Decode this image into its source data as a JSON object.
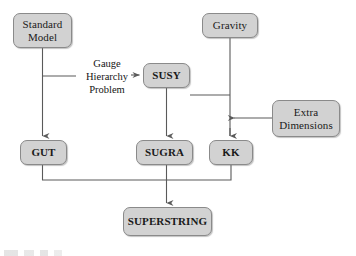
{
  "diagram": {
    "background_color": "#ffffff",
    "node_fill": "#d2d2d2",
    "node_border": "#8a8a8a",
    "line_color": "#5a5a5a",
    "nodes": [
      {
        "id": "standard-model",
        "label": "Standard\nModel",
        "x": 13,
        "y": 13,
        "w": 59,
        "h": 35,
        "font_size": 11
      },
      {
        "id": "gravity",
        "label": "Gravity",
        "x": 202,
        "y": 13,
        "w": 56,
        "h": 25,
        "font_size": 11
      },
      {
        "id": "susy",
        "label": "SUSY",
        "x": 143,
        "y": 63,
        "w": 47,
        "h": 25,
        "font_size": 11
      },
      {
        "id": "extra-dimensions",
        "label": "Extra\nDimensions",
        "x": 272,
        "y": 100,
        "w": 68,
        "h": 37,
        "font_size": 11
      },
      {
        "id": "gut",
        "label": "GUT",
        "x": 20,
        "y": 140,
        "w": 47,
        "h": 25,
        "font_size": 11
      },
      {
        "id": "sugra",
        "label": "SUGRA",
        "x": 136,
        "y": 140,
        "w": 57,
        "h": 25,
        "font_size": 11
      },
      {
        "id": "kk",
        "label": "KK",
        "x": 209,
        "y": 140,
        "w": 44,
        "h": 25,
        "font_size": 11
      },
      {
        "id": "superstring",
        "label": "SUPERSTRING",
        "x": 123,
        "y": 207,
        "w": 89,
        "h": 29,
        "font_size": 11
      }
    ],
    "annotations": [
      {
        "id": "gauge-hierarchy-problem",
        "label": "Gauge\nHierarchy\nProblem",
        "x": 76,
        "y": 57,
        "w": 62,
        "font_size": 10.5
      }
    ],
    "edges": [
      {
        "id": "standard-model-to-gut",
        "from": "standard-model",
        "to": "gut",
        "arrow": true
      },
      {
        "id": "gauge-hierarchy-to-susy",
        "from": "gauge-hierarchy-problem",
        "to": "susy",
        "arrow": true
      },
      {
        "id": "standard-model-to-gauge-hierarchy",
        "from": "standard-model",
        "to": "gauge-hierarchy-problem",
        "arrow": false
      },
      {
        "id": "gravity-to-susy",
        "from": "gravity",
        "to": "susy",
        "arrow": false
      },
      {
        "id": "gravity-to-kk",
        "from": "gravity",
        "to": "kk",
        "arrow": true
      },
      {
        "id": "gravity-to-sugra",
        "from": "gravity",
        "to": "sugra",
        "arrow": true
      },
      {
        "id": "susy-to-sugra",
        "from": "susy",
        "to": "sugra",
        "arrow": true
      },
      {
        "id": "extra-dimensions-to-gravity-line",
        "from": "extra-dimensions",
        "to": "gravity",
        "arrow": true
      },
      {
        "id": "gut-to-superstring",
        "from": "gut",
        "to": "superstring",
        "arrow": false
      },
      {
        "id": "sugra-to-superstring",
        "from": "sugra",
        "to": "superstring",
        "arrow": true
      },
      {
        "id": "kk-to-superstring",
        "from": "kk",
        "to": "superstring",
        "arrow": false
      }
    ]
  }
}
